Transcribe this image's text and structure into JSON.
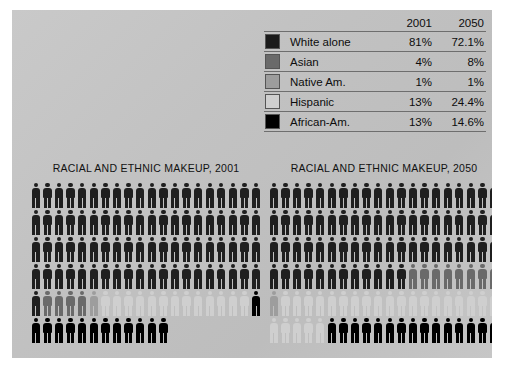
{
  "panel": {
    "background_color": "#c4c4c4"
  },
  "legend": {
    "columns": [
      "2001",
      "2050"
    ],
    "rows": [
      {
        "label": "White alone",
        "color": "#1b1b1b",
        "v2001": "81%",
        "v2050": "72.1%"
      },
      {
        "label": "Asian",
        "color": "#6a6a6a",
        "v2001": "4%",
        "v2050": "8%"
      },
      {
        "label": "Native Am.",
        "color": "#9d9d9d",
        "v2001": "1%",
        "v2050": "1%"
      },
      {
        "label": "Hispanic",
        "color": "#cfcfcf",
        "v2001": "13%",
        "v2050": "24.4%"
      },
      {
        "label": "African-Am.",
        "color": "#000000",
        "v2001": "13%",
        "v2050": "14.6%"
      }
    ]
  },
  "charts": [
    {
      "id": "chart-2001",
      "title": "RACIAL AND ETHNIC MAKEUP, 2001",
      "year": "2001",
      "per_row": 20,
      "total_figures": 112,
      "runs": [
        {
          "group": "White alone",
          "color": "#1f1f1f",
          "count": 81
        },
        {
          "group": "Asian",
          "color": "#6a6a6a",
          "count": 4
        },
        {
          "group": "Native Am.",
          "color": "#9d9d9d",
          "count": 1
        },
        {
          "group": "Hispanic",
          "color": "#cfcfcf",
          "count": 13
        },
        {
          "group": "African-Am.",
          "color": "#000000",
          "count": 13
        }
      ]
    },
    {
      "id": "chart-2050",
      "title": "RACIAL AND ETHNIC MAKEUP, 2050",
      "year": "2050",
      "per_row": 20,
      "total_figures": 100,
      "runs": [
        {
          "group": "White alone",
          "color": "#1f1f1f",
          "count": 72
        },
        {
          "group": "Asian",
          "color": "#6a6a6a",
          "count": 8
        },
        {
          "group": "Native Am.",
          "color": "#9d9d9d",
          "count": 1
        },
        {
          "group": "Hispanic",
          "color": "#cfcfcf",
          "count": 24
        },
        {
          "group": "African-Am.",
          "color": "#000000",
          "count": 15
        }
      ]
    }
  ],
  "chart_data": {
    "type": "pictogram",
    "unit": "1 figure = 1 percent of population",
    "categories": [
      "White alone",
      "Asian",
      "Native Am.",
      "Hispanic",
      "African-Am."
    ],
    "series": [
      {
        "name": "2001",
        "values": [
          81,
          4,
          1,
          13,
          13
        ],
        "labels": [
          "81%",
          "4%",
          "1%",
          "13%",
          "13%"
        ]
      },
      {
        "name": "2050",
        "values": [
          72.1,
          8,
          1,
          24.4,
          14.6
        ],
        "labels": [
          "72.1%",
          "8%",
          "1%",
          "24.4%",
          "14.6%"
        ]
      }
    ],
    "colors": [
      "#1b1b1b",
      "#6a6a6a",
      "#9d9d9d",
      "#cfcfcf",
      "#000000"
    ],
    "figures_per_row": 20,
    "legend_position": "top-right",
    "grid": false
  }
}
